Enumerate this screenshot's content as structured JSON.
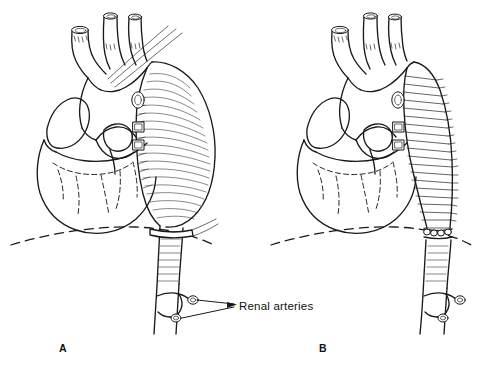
{
  "figure": {
    "background_color": "#ffffff",
    "ink_color": "#1a1a1a",
    "width": 479,
    "height": 368,
    "style": "black-and-white pen-and-ink medical line drawing"
  },
  "panels": [
    {
      "id": "A",
      "letter": "A",
      "letter_x": 63,
      "letter_y": 352,
      "caption": "Heart with large fusiform descending thoracic aortic aneurysm",
      "structures": [
        "aortic arch",
        "innominate artery",
        "left common carotid artery",
        "left subclavian artery",
        "ascending aorta",
        "pulmonary artery",
        "right atrial appendage",
        "left ventricle",
        "coronary arteries",
        "descending thoracic aortic aneurysm",
        "diaphragm",
        "abdominal aorta",
        "renal arteries"
      ]
    },
    {
      "id": "B",
      "letter": "B",
      "letter_x": 323,
      "letter_y": 352,
      "caption": "Same anatomy after replacement of the aneurysm with a corrugated tube graft",
      "structures": [
        "aortic arch",
        "innominate artery",
        "left common carotid artery",
        "left subclavian artery",
        "ascending aorta",
        "pulmonary artery",
        "right atrial appendage",
        "left ventricle",
        "coronary arteries",
        "corrugated Dacron tube graft",
        "proximal anastomosis",
        "distal anastomosis with sutures",
        "diaphragm",
        "abdominal aorta",
        "renal arteries"
      ]
    }
  ],
  "annotations": [
    {
      "id": "renal-arteries",
      "text": "Renal arteries",
      "text_x": 239,
      "text_y": 311,
      "leader_from_x": 234,
      "leader_to_x": 186,
      "arrow": "left",
      "points_to": "renal arteries of panel A"
    }
  ],
  "label_text": {
    "renal_arteries": "Renal arteries",
    "panel_a": "A",
    "panel_b": "B"
  }
}
